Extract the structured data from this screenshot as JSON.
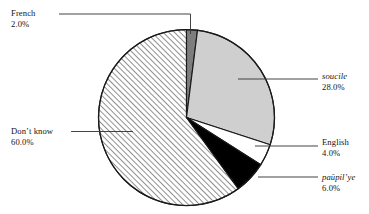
{
  "chart_data": {
    "type": "pie",
    "title": "",
    "subtitle": "",
    "xlabel": "",
    "ylabel": "",
    "legend_position": "callout-labels",
    "grid": false,
    "start_angle_deg": 0,
    "direction": "clockwise",
    "center": {
      "x": 186.5,
      "y": 117.5
    },
    "radius": 88,
    "categories": [
      "French",
      "soucile",
      "English",
      "paŭpil’ye",
      "Don’t know"
    ],
    "values": [
      2.0,
      28.0,
      4.0,
      6.0,
      60.0
    ],
    "value_labels": [
      "2.0%",
      "28.0%",
      "4.0%",
      "6.0%",
      "60.0%"
    ],
    "slices": [
      {
        "name": "French",
        "label": "French",
        "value": 2.0,
        "value_label": "2.0%",
        "fill": "#7d7d7d",
        "fill_style": "solid",
        "italic": false,
        "start_deg": 0.0,
        "end_deg": 7.2
      },
      {
        "name": "soucile",
        "label": "soucile",
        "value": 28.0,
        "value_label": "28.0%",
        "fill": "#cfcfcf",
        "fill_style": "solid",
        "italic": true,
        "start_deg": 7.2,
        "end_deg": 108.0
      },
      {
        "name": "English",
        "label": "English",
        "value": 4.0,
        "value_label": "4.0%",
        "fill": "#ffffff",
        "fill_style": "solid",
        "italic": false,
        "start_deg": 108.0,
        "end_deg": 122.4
      },
      {
        "name": "paupilye",
        "label": "paŭpil’ye",
        "value": 6.0,
        "value_label": "6.0%",
        "fill": "#000000",
        "fill_style": "solid",
        "italic": true,
        "start_deg": 122.4,
        "end_deg": 144.0
      },
      {
        "name": "dont-know",
        "label": "Don’t know",
        "value": 60.0,
        "value_label": "60.0%",
        "fill": "#ffffff",
        "fill_style": "diagonal-hatch",
        "italic": false,
        "start_deg": 144.0,
        "end_deg": 360.0
      }
    ],
    "colors": {
      "stroke": "#1a1a1a",
      "background": "#ffffff",
      "light_gray": "#cfcfcf",
      "dark_gray": "#7d7d7d",
      "black": "#000000",
      "hatch": "#2b2b2b",
      "leader_line": "#3a3a3a"
    }
  }
}
